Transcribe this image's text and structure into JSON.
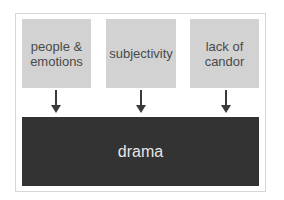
{
  "diagram": {
    "causes": [
      {
        "label_line1": "people &",
        "label_line2": "emotions"
      },
      {
        "label_line1": "subjectivity",
        "label_line2": ""
      },
      {
        "label_line1": "lack of",
        "label_line2": "candor"
      }
    ],
    "effect": {
      "label": "drama"
    },
    "colors": {
      "cause_box": "#d2d2d2",
      "cause_text": "#4a4a4a",
      "effect_box": "#333333",
      "effect_text": "#e6e6e6",
      "arrow": "#3a3a3a",
      "frame_border": "#d6d6d6"
    }
  }
}
